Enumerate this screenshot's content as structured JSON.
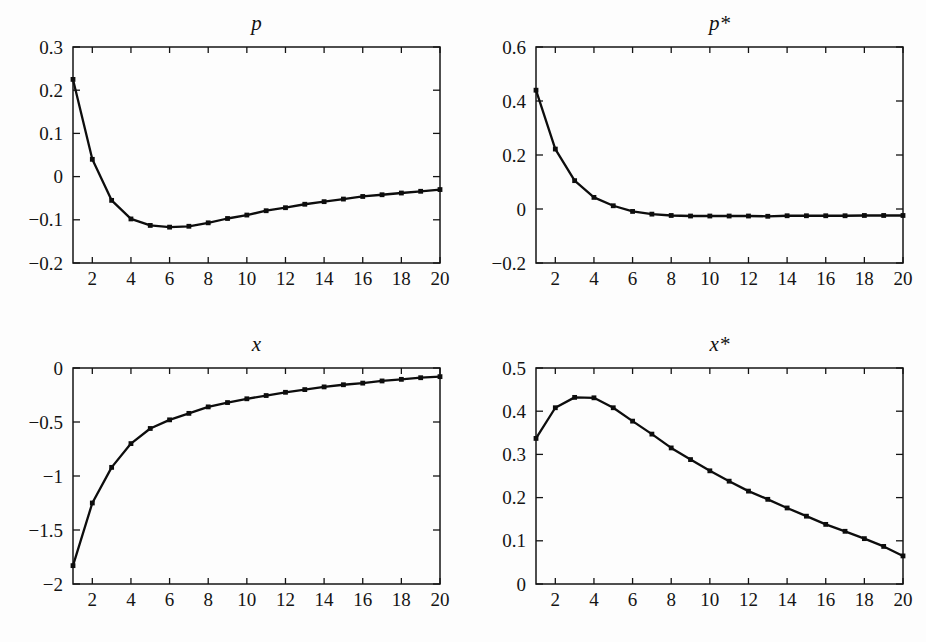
{
  "figure": {
    "name": "four-panel-impulse-response-figure",
    "background_color": "#fdfdfd",
    "line_color": "#0d0d0d",
    "axis_color": "#141414",
    "panel_count": 4
  },
  "chart_data": [
    {
      "id": "p",
      "type": "line",
      "title": "p",
      "title_style": "italic",
      "xlabel": "",
      "ylabel": "",
      "xlim": [
        1,
        20
      ],
      "ylim": [
        -0.2,
        0.3
      ],
      "grid": false,
      "legend": "none",
      "marker": "square",
      "xticks": [
        2,
        4,
        6,
        8,
        10,
        12,
        14,
        16,
        18,
        20
      ],
      "xticklabels": [
        "2",
        "4",
        "6",
        "8",
        "10",
        "12",
        "14",
        "16",
        "18",
        "20"
      ],
      "yticks": [
        -0.2,
        -0.1,
        0,
        0.1,
        0.2,
        0.3
      ],
      "yticklabels": [
        "−0.2",
        "−0.1",
        "0",
        "0.1",
        "0.2",
        "0.3"
      ],
      "x": [
        1,
        2,
        3,
        4,
        5,
        6,
        7,
        8,
        9,
        10,
        11,
        12,
        13,
        14,
        15,
        16,
        17,
        18,
        19,
        20
      ],
      "values": [
        0.225,
        0.04,
        -0.055,
        -0.098,
        -0.113,
        -0.117,
        -0.115,
        -0.107,
        -0.097,
        -0.089,
        -0.079,
        -0.072,
        -0.064,
        -0.058,
        -0.052,
        -0.046,
        -0.042,
        -0.038,
        -0.034,
        -0.03
      ]
    },
    {
      "id": "p_star",
      "type": "line",
      "title": "p*",
      "title_style": "italic",
      "xlabel": "",
      "ylabel": "",
      "xlim": [
        1,
        20
      ],
      "ylim": [
        -0.2,
        0.6
      ],
      "grid": false,
      "legend": "none",
      "marker": "square",
      "xticks": [
        2,
        4,
        6,
        8,
        10,
        12,
        14,
        16,
        18,
        20
      ],
      "xticklabels": [
        "2",
        "4",
        "6",
        "8",
        "10",
        "12",
        "14",
        "16",
        "18",
        "20"
      ],
      "yticks": [
        -0.2,
        0,
        0.2,
        0.4,
        0.6
      ],
      "yticklabels": [
        "−0.2",
        "0",
        "0.2",
        "0.4",
        "0.6"
      ],
      "x": [
        1,
        2,
        3,
        4,
        5,
        6,
        7,
        8,
        9,
        10,
        11,
        12,
        13,
        14,
        15,
        16,
        17,
        18,
        19,
        20
      ],
      "values": [
        0.44,
        0.222,
        0.105,
        0.043,
        0.012,
        -0.009,
        -0.019,
        -0.024,
        -0.026,
        -0.026,
        -0.026,
        -0.026,
        -0.027,
        -0.025,
        -0.025,
        -0.025,
        -0.025,
        -0.024,
        -0.024,
        -0.024
      ]
    },
    {
      "id": "x",
      "type": "line",
      "title": "x",
      "title_style": "italic",
      "xlabel": "",
      "ylabel": "",
      "xlim": [
        1,
        20
      ],
      "ylim": [
        -2,
        0
      ],
      "grid": false,
      "legend": "none",
      "marker": "square",
      "xticks": [
        2,
        4,
        6,
        8,
        10,
        12,
        14,
        16,
        18,
        20
      ],
      "xticklabels": [
        "2",
        "4",
        "6",
        "8",
        "10",
        "12",
        "14",
        "16",
        "18",
        "20"
      ],
      "yticks": [
        -2,
        -1.5,
        -1,
        -0.5,
        0
      ],
      "yticklabels": [
        "−2",
        "−1.5",
        "−1",
        "−0.5",
        "0"
      ],
      "x": [
        1,
        2,
        3,
        4,
        5,
        6,
        7,
        8,
        9,
        10,
        11,
        12,
        13,
        14,
        15,
        16,
        17,
        18,
        19,
        20
      ],
      "values": [
        -1.83,
        -1.25,
        -0.92,
        -0.7,
        -0.56,
        -0.48,
        -0.42,
        -0.36,
        -0.32,
        -0.285,
        -0.255,
        -0.225,
        -0.2,
        -0.175,
        -0.155,
        -0.14,
        -0.12,
        -0.105,
        -0.09,
        -0.08
      ]
    },
    {
      "id": "x_star",
      "type": "line",
      "title": "x*",
      "title_style": "italic",
      "xlabel": "",
      "ylabel": "",
      "xlim": [
        1,
        20
      ],
      "ylim": [
        0,
        0.5
      ],
      "grid": false,
      "legend": "none",
      "marker": "square",
      "xticks": [
        2,
        4,
        6,
        8,
        10,
        12,
        14,
        16,
        18,
        20
      ],
      "xticklabels": [
        "2",
        "4",
        "6",
        "8",
        "10",
        "12",
        "14",
        "16",
        "18",
        "20"
      ],
      "yticks": [
        0,
        0.1,
        0.2,
        0.3,
        0.4,
        0.5
      ],
      "yticklabels": [
        "0",
        "0.1",
        "0.2",
        "0.3",
        "0.4",
        "0.5"
      ],
      "x": [
        1,
        2,
        3,
        4,
        5,
        6,
        7,
        8,
        9,
        10,
        11,
        12,
        13,
        14,
        15,
        16,
        17,
        18,
        19,
        20
      ],
      "values": [
        0.337,
        0.408,
        0.432,
        0.431,
        0.408,
        0.377,
        0.347,
        0.315,
        0.288,
        0.262,
        0.238,
        0.215,
        0.196,
        0.176,
        0.157,
        0.138,
        0.122,
        0.105,
        0.087,
        0.065
      ]
    }
  ]
}
